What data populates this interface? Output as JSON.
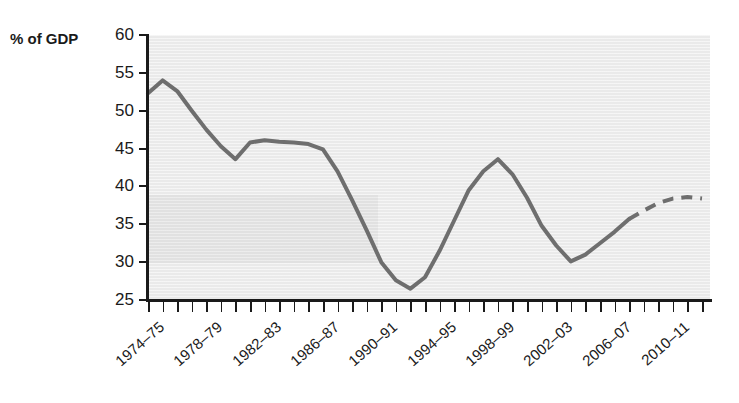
{
  "axis_title": "% of GDP",
  "colors": {
    "line": "#6e6e6e",
    "plot_background": "#eaeaea",
    "axis": "#1a1a1a",
    "text": "#1a1a1a"
  },
  "chart_data": {
    "type": "line",
    "title": "",
    "subtitle": "",
    "xlabel": "",
    "ylabel": "% of GDP",
    "ylim": [
      25,
      60
    ],
    "y_ticks": [
      25,
      30,
      35,
      40,
      45,
      50,
      55,
      60
    ],
    "grid": false,
    "legend": null,
    "x_tick_labels": [
      "1974–75",
      "1978–79",
      "1982–83",
      "1986–87",
      "1990–91",
      "1994–95",
      "1998–99",
      "2002–03",
      "2006–07",
      "2010–11"
    ],
    "x_tick_label_interval": 4,
    "x": [
      "1974–75",
      "1975–76",
      "1976–77",
      "1977–78",
      "1978–79",
      "1979–80",
      "1980–81",
      "1981–82",
      "1982–83",
      "1983–84",
      "1984–85",
      "1985–86",
      "1986–87",
      "1987–88",
      "1988–89",
      "1989–90",
      "1990–91",
      "1991–92",
      "1992–93",
      "1993–94",
      "1994–95",
      "1995–96",
      "1996–97",
      "1997–98",
      "1998–99",
      "1999–00",
      "2000–01",
      "2001–02",
      "2002–03",
      "2003–04",
      "2004–05",
      "2005–06",
      "2006–07",
      "2007–08",
      "2008–09",
      "2009–10",
      "2010–11",
      "2011–12",
      "2012–13"
    ],
    "series": [
      {
        "name": "Public spending",
        "style": "solid",
        "values": [
          52.3,
          54.0,
          52.6,
          50.0,
          47.5,
          45.3,
          43.6,
          45.8,
          46.1,
          45.9,
          45.8,
          45.6,
          44.9,
          42.0,
          38.2,
          34.2,
          30.0,
          27.6,
          26.5,
          28.0,
          31.5,
          35.5,
          39.5,
          42.0,
          43.6,
          41.6,
          38.5,
          34.8,
          32.2,
          30.1,
          31.0,
          32.5,
          34.0,
          35.7,
          null,
          null,
          null,
          null,
          null
        ]
      },
      {
        "name": "Public spending (projected)",
        "style": "dashed",
        "values": [
          null,
          null,
          null,
          null,
          null,
          null,
          null,
          null,
          null,
          null,
          null,
          null,
          null,
          null,
          null,
          null,
          null,
          null,
          null,
          null,
          null,
          null,
          null,
          null,
          null,
          null,
          null,
          null,
          null,
          null,
          null,
          null,
          null,
          35.7,
          36.8,
          37.8,
          38.4,
          38.6,
          38.4
        ]
      }
    ]
  }
}
